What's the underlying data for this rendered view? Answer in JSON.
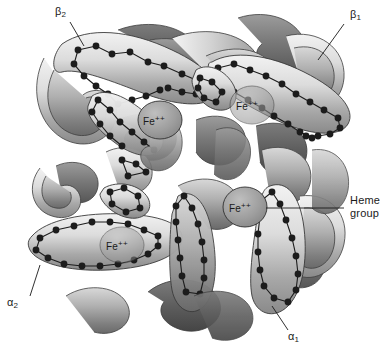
{
  "figure": {
    "type": "molecular-structure-diagram",
    "background_color": "#ffffff",
    "style": "grayscale ribbon and tube model with residue dot chains"
  },
  "labels": {
    "beta2": {
      "text": "β",
      "sub": "2"
    },
    "beta1": {
      "text": "β",
      "sub": "1"
    },
    "alpha2": {
      "text": "α",
      "sub": "2"
    },
    "alpha1": {
      "text": "α",
      "sub": "1"
    },
    "heme_group_line1": "Heme",
    "heme_group_line2": "group"
  },
  "iron_sites": [
    {
      "id": "fe-beta2",
      "text": "Fe",
      "sup": "++",
      "x": 160,
      "y": 120
    },
    {
      "id": "fe-beta1",
      "text": "Fe",
      "sup": "++",
      "x": 252,
      "y": 105
    },
    {
      "id": "fe-alpha1",
      "text": "Fe",
      "sup": "++",
      "x": 245,
      "y": 207
    },
    {
      "id": "fe-alpha2",
      "text": "Fe",
      "sup": "++",
      "x": 122,
      "y": 245
    }
  ],
  "subunits": [
    {
      "id": "beta2",
      "label": "β2",
      "position": "top-left"
    },
    {
      "id": "beta1",
      "label": "β1",
      "position": "top-right"
    },
    {
      "id": "alpha2",
      "label": "α2",
      "position": "bottom-left"
    },
    {
      "id": "alpha1",
      "label": "α1",
      "position": "bottom-right"
    }
  ],
  "colors": {
    "background": "#ffffff",
    "ribbon_light": "#e8e8e8",
    "ribbon_mid": "#b5b5b5",
    "ribbon_dark": "#6e6e6e",
    "ribbon_darkest": "#4a4a4a",
    "residue_dot": "#1c1c1c",
    "outline": "#3a3a3a",
    "label_text": "#1a1a1a",
    "heme_disc": "#9a9a9a"
  }
}
